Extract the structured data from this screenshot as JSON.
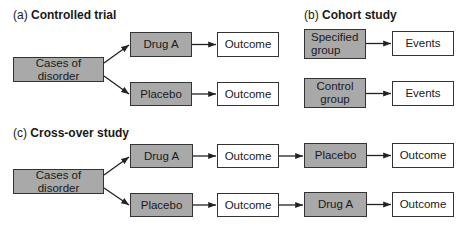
{
  "panels": {
    "a": {
      "label": "(a)",
      "title": "Controlled trial",
      "source": "Cases of disorder",
      "arms": [
        {
          "treatment": "Drug A",
          "result": "Outcome"
        },
        {
          "treatment": "Placebo",
          "result": "Outcome"
        }
      ]
    },
    "b": {
      "label": "(b)",
      "title": "Cohort study",
      "groups": [
        {
          "group": "Specified group",
          "result": "Events"
        },
        {
          "group": "Control group",
          "result": "Events"
        }
      ]
    },
    "c": {
      "label": "(c)",
      "title": "Cross-over study",
      "source": "Cases of disorder",
      "arms": [
        {
          "first": "Drug A",
          "result1": "Outcome",
          "second": "Placebo",
          "result2": "Outcome"
        },
        {
          "first": "Placebo",
          "result1": "Outcome",
          "second": "Drug A",
          "result2": "Outcome"
        }
      ]
    }
  },
  "colors": {
    "intervention_fill": "#a9a9a9",
    "outcome_fill": "#ffffff",
    "border": "#333333"
  }
}
